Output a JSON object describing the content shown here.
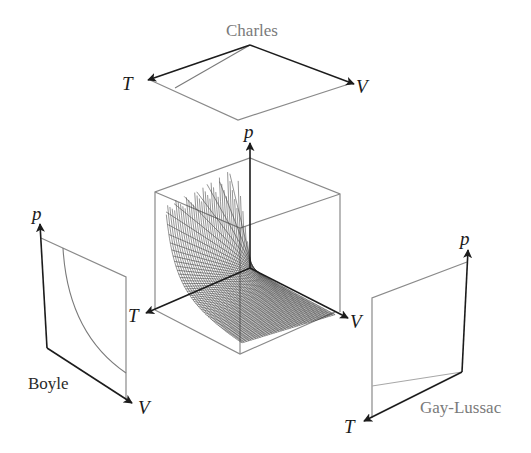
{
  "figure": {
    "panels": {
      "charles": {
        "label": "Charles",
        "axis_t": "T",
        "axis_v": "V"
      },
      "surface": {
        "axis_p": "p",
        "axis_t": "T",
        "axis_v": "V"
      },
      "boyle": {
        "label": "Boyle",
        "axis_p": "p",
        "axis_v": "V"
      },
      "gay_lussac": {
        "label": "Gay-Lussac",
        "axis_p": "p",
        "axis_t": "T"
      }
    },
    "colors": {
      "axis": "#1c1c1c",
      "edge": "#8a8a8a",
      "mesh": "#3a3a3a",
      "label_gray": "#7a7a7a"
    }
  }
}
